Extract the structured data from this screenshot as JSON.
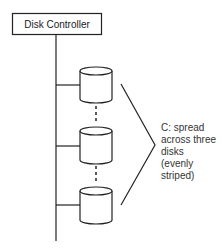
{
  "diagram": {
    "controller": {
      "label": "Disk Controller"
    },
    "disks": [
      {
        "name": "disk-1"
      },
      {
        "name": "disk-2"
      },
      {
        "name": "disk-3"
      }
    ],
    "annotation": {
      "lines": [
        "C: spread",
        "across three",
        "disks",
        "(evenly",
        "striped)"
      ]
    },
    "colors": {
      "stroke": "#222222",
      "background": "#ffffff"
    }
  }
}
